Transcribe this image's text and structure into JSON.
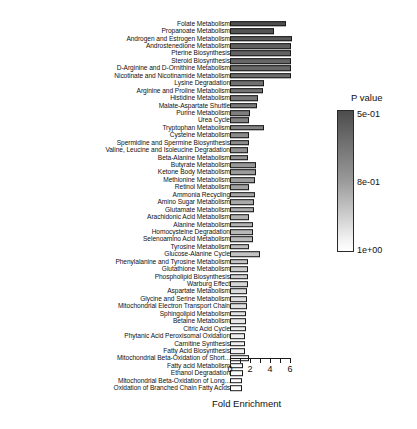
{
  "chart_data": {
    "type": "bar",
    "orientation": "horizontal",
    "title": "",
    "xlabel": "Fold Enrichment",
    "ylabel": "",
    "xlim": [
      0,
      6.5
    ],
    "xticks": [
      0,
      1,
      2,
      3,
      4,
      5,
      6
    ],
    "xticklabels": [
      "0",
      "",
      "2",
      "",
      "4",
      "",
      "6"
    ],
    "grid": false,
    "legend": {
      "title": "P value",
      "position": "right",
      "type": "colorbar",
      "ticks": [
        "5e-01",
        "8e-01",
        "1e+00"
      ],
      "color_high": "#4d4d4d",
      "color_mid": "#9a9a9a",
      "color_low": "#ffffff"
    },
    "value_key": "Fold Enrichment",
    "color_key": "P value",
    "categories": [
      "Folate Metabolism",
      "Propanoate Metabolism",
      "Androgen and Estrogen Metabolism",
      "Androstenedione Metabolism",
      "Pterine Biosynthesis",
      "Steroid Biosynthesis",
      "D-Arginine and D-Ornithine Metabolism",
      "Nicotinate and Nicotinamide Metabolism",
      "Lysine Degradation",
      "Arginine and Proline Metabolism",
      "Histidine Metabolism",
      "Malate-Aspartate Shuttle",
      "Purine Metabolism",
      "Urea Cycle",
      "Tryptophan Metabolism",
      "Cysteine Metabolism",
      "Spermidine and Spermine Biosynthesis",
      "Valine, Leucine and Isoleucine Degradation",
      "Beta-Alanine Metabolism",
      "Butyrate Metabolism",
      "Ketone Body Metabolism",
      "Methionine Metabolism",
      "Retinol Metabolism",
      "Ammonia Recycling",
      "Amino Sugar Metabolism",
      "Glutamate Metabolism",
      "Arachidonic Acid Metabolism",
      "Alanine Metabolism",
      "Homocysteine Degradation",
      "Selenoamino Acid Metabolism",
      "Tyrosine Metabolism",
      "Glucose-Alanine Cycle",
      "Phenylalanine and Tyrosine Metabolism",
      "Glutathione Metabolism",
      "Phospholipid Biosynthesis",
      "Warburg Effect",
      "Aspartate Metabolism",
      "Glycine and Serine Metabolism",
      "Mitochondrial Electron Transport Chain",
      "Sphingolipid Metabolism",
      "Betaine Metabolism",
      "Citric Acid Cycle",
      "Phytanic Acid Peroxisomal Oxidation",
      "Carnitine Synthesis",
      "Fatty Acid Biosynthesis",
      "Mitochondrial Beta-Oxidation of Short...",
      "Fatty acid Metabolism",
      "Ethanol Degradation",
      "Mitochondrial Beta-Oxidation of Long...",
      "Oxidation of Branched Chain Fatty Acids"
    ],
    "values": [
      5.55,
      4.4,
      6.15,
      6.05,
      6.05,
      6.05,
      6.05,
      6.05,
      3.35,
      3.3,
      2.75,
      2.7,
      1.95,
      1.9,
      3.35,
      1.9,
      1.85,
      1.8,
      1.8,
      2.55,
      2.55,
      2.5,
      1.9,
      2.45,
      2.4,
      2.35,
      1.85,
      2.3,
      2.3,
      2.25,
      1.85,
      3.0,
      1.8,
      1.8,
      1.75,
      1.75,
      1.7,
      1.7,
      1.65,
      1.6,
      1.6,
      1.55,
      1.5,
      1.5,
      1.5,
      1.9,
      1.3,
      1.25,
      1.2,
      1.2
    ],
    "pvalues": [
      0.5,
      0.52,
      0.54,
      0.55,
      0.56,
      0.57,
      0.58,
      0.59,
      0.6,
      0.61,
      0.62,
      0.63,
      0.64,
      0.65,
      0.66,
      0.67,
      0.68,
      0.69,
      0.7,
      0.71,
      0.72,
      0.73,
      0.74,
      0.75,
      0.76,
      0.77,
      0.78,
      0.79,
      0.8,
      0.81,
      0.82,
      0.83,
      0.84,
      0.855,
      0.87,
      0.885,
      0.895,
      0.905,
      0.915,
      0.925,
      0.935,
      0.945,
      0.952,
      0.96,
      0.967,
      0.973,
      0.979,
      0.985,
      0.991,
      0.997
    ]
  }
}
